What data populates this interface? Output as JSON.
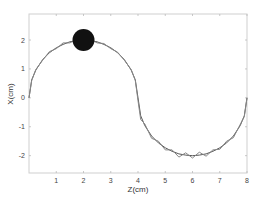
{
  "chart_data": {
    "type": "line",
    "title": "",
    "xlabel": "Z(cm)",
    "ylabel": "X(cm)",
    "xlim": [
      0,
      8
    ],
    "ylim": [
      -2.6,
      2.9
    ],
    "xticks": [
      1,
      2,
      3,
      4,
      5,
      6,
      7,
      8
    ],
    "yticks": [
      -2,
      -1,
      0,
      1,
      2
    ],
    "grid": false,
    "legend": null,
    "series": [
      {
        "name": "reference",
        "color": "#555555",
        "x": [
          0,
          0.1,
          0.25,
          0.5,
          0.75,
          1.0,
          1.25,
          1.5,
          1.75,
          2.0,
          2.25,
          2.5,
          2.75,
          3.0,
          3.25,
          3.5,
          3.75,
          3.9,
          4.0,
          4.1,
          4.25,
          4.5,
          4.75,
          5.0,
          5.25,
          5.5,
          5.75,
          6.0,
          6.25,
          6.5,
          6.75,
          7.0,
          7.25,
          7.5,
          7.75,
          7.9,
          8.0
        ],
        "y": [
          0,
          0.62,
          0.96,
          1.32,
          1.56,
          1.73,
          1.85,
          1.94,
          1.98,
          2.0,
          1.98,
          1.94,
          1.85,
          1.73,
          1.56,
          1.32,
          0.96,
          0.62,
          0,
          -0.62,
          -0.96,
          -1.32,
          -1.56,
          -1.73,
          -1.85,
          -1.94,
          -1.98,
          -2.0,
          -1.98,
          -1.94,
          -1.85,
          -1.73,
          -1.56,
          -1.32,
          -0.96,
          -0.62,
          0
        ]
      },
      {
        "name": "measured",
        "color": "#888888",
        "x": [
          0,
          0.1,
          0.25,
          0.5,
          0.75,
          1.0,
          1.25,
          1.5,
          1.75,
          2.0,
          2.25,
          2.5,
          2.75,
          3.0,
          3.25,
          3.5,
          3.75,
          3.9,
          4.0,
          4.1,
          4.25,
          4.5,
          4.75,
          5.0,
          5.25,
          5.5,
          5.75,
          6.0,
          6.25,
          6.5,
          6.75,
          7.0,
          7.25,
          7.5,
          7.75,
          7.9,
          8.0
        ],
        "y": [
          0,
          0.6,
          0.98,
          1.3,
          1.6,
          1.7,
          1.9,
          1.9,
          2.02,
          2.0,
          2.02,
          1.9,
          1.88,
          1.7,
          1.58,
          1.3,
          0.98,
          0.6,
          -0.1,
          -0.75,
          -0.9,
          -1.4,
          -1.5,
          -1.8,
          -1.8,
          -2.05,
          -1.9,
          -2.08,
          -1.88,
          -2.02,
          -1.8,
          -1.78,
          -1.5,
          -1.38,
          -0.92,
          -0.65,
          0
        ]
      }
    ],
    "annotations": [
      {
        "type": "marker",
        "shape": "filled-circle",
        "x": 2,
        "y": 2,
        "color": "#111111"
      }
    ]
  }
}
